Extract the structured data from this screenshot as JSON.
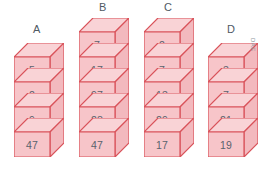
{
  "figure": {
    "type": "isometric-block-stacks",
    "background_color": "#ffffff",
    "block_fill_color": "#f7c5c9",
    "block_top_fill_color": "#f9d3d6",
    "block_side_fill_color": "#f3b9be",
    "block_border_color": "#d9525a",
    "number_text_color": "#59636d",
    "label_text_color": "#4f5a64",
    "watermark_text_color": "#8c939b"
  },
  "watermark": {
    "text": "DAE"
  },
  "stacks": [
    {
      "label": "A",
      "count": 4,
      "values": [
        "5",
        "2",
        "9",
        "47"
      ]
    },
    {
      "label": "B",
      "count": 5,
      "values": [
        "7",
        "17",
        "97",
        "28",
        "47"
      ]
    },
    {
      "label": "C",
      "count": 5,
      "values": [
        "2",
        "7",
        "13",
        "29",
        "17"
      ]
    },
    {
      "label": "D",
      "count": 4,
      "values": [
        "3",
        "7",
        "21",
        "19"
      ]
    }
  ]
}
